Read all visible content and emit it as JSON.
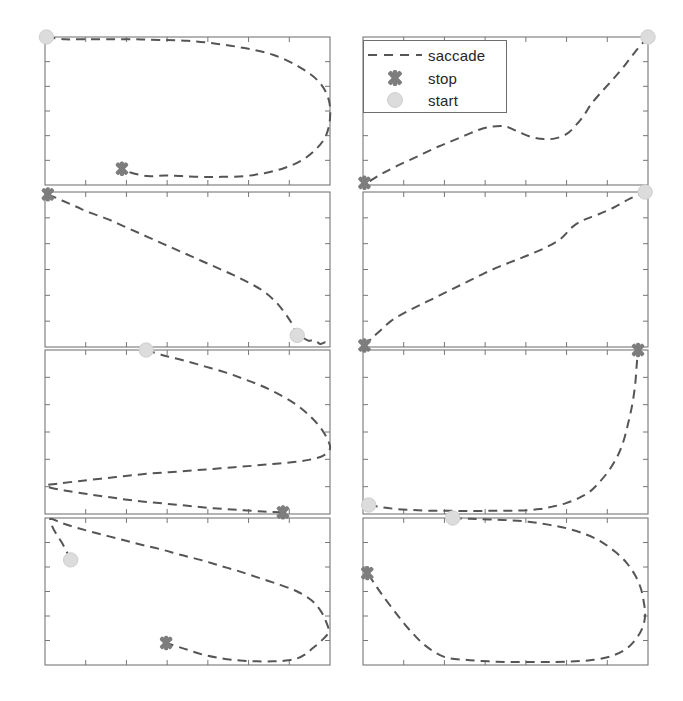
{
  "figure": {
    "kind": "small-multiples-trajectory-grid",
    "rows": 4,
    "cols": 2,
    "background": "#ffffff"
  },
  "legend": {
    "position": "top-right-panel-overlay",
    "border_color": "#6e6e6e",
    "entries": [
      {
        "key": "saccade-dashed-line",
        "label": "saccade",
        "color": "#555555",
        "style": "dashed"
      },
      {
        "key": "stop-marker",
        "label": "stop",
        "color": "#7d7d7d",
        "style": "x-marker"
      },
      {
        "key": "start-marker",
        "label": "start",
        "color": "#dcdcdc",
        "style": "circle-marker"
      }
    ]
  },
  "colors": {
    "saccade_line": "#555555",
    "stop_marker": "#7d7d7d",
    "start_marker": "#dcdcdc",
    "axis": "#777777",
    "text": "#262626"
  },
  "chart_data": {
    "type": "line",
    "title": "",
    "subtitle": "",
    "xlabel": "",
    "ylabel": "",
    "grid": false,
    "legend_position": "top-right",
    "axis_ticks": {
      "x_count": 7,
      "y_count": 6,
      "tick_direction": "inward",
      "tick_labels": []
    },
    "xlim": [
      0,
      1
    ],
    "ylim": [
      0,
      1
    ],
    "note": "Each panel is one saccade trajectory in normalized panel coordinates; x to the right, y upward (0 at panel bottom, 1 at panel top). Markers: start circle, stop X.",
    "panels": [
      {
        "index": 1,
        "position": "row1-col1",
        "start": [
          0.005,
          1.0
        ],
        "stop": [
          0.27,
          0.11
        ],
        "x": [
          0.005,
          0.07,
          0.14,
          0.22,
          0.31,
          0.4,
          0.5,
          0.6,
          0.7,
          0.8,
          0.89,
          0.96,
          0.995,
          1.0,
          0.985,
          0.95,
          0.9,
          0.84,
          0.77,
          0.7,
          0.62,
          0.55,
          0.48,
          0.42,
          0.36,
          0.3,
          0.27
        ],
        "y": [
          1.0,
          0.985,
          0.985,
          0.985,
          0.985,
          0.98,
          0.975,
          0.955,
          0.925,
          0.88,
          0.8,
          0.7,
          0.58,
          0.45,
          0.33,
          0.24,
          0.165,
          0.115,
          0.08,
          0.06,
          0.055,
          0.055,
          0.06,
          0.065,
          0.06,
          0.085,
          0.11
        ]
      },
      {
        "index": 2,
        "position": "row1-col2",
        "start": [
          1.0,
          1.0
        ],
        "stop": [
          0.005,
          0.015
        ],
        "x": [
          1.0,
          0.955,
          0.915,
          0.875,
          0.835,
          0.8,
          0.775,
          0.745,
          0.715,
          0.675,
          0.635,
          0.59,
          0.545,
          0.5,
          0.455,
          0.41,
          0.365,
          0.315,
          0.265,
          0.215,
          0.165,
          0.115,
          0.07,
          0.035,
          0.015,
          0.005
        ],
        "y": [
          1.0,
          0.9,
          0.8,
          0.71,
          0.625,
          0.545,
          0.47,
          0.4,
          0.345,
          0.315,
          0.31,
          0.325,
          0.36,
          0.395,
          0.395,
          0.375,
          0.34,
          0.3,
          0.26,
          0.215,
          0.17,
          0.125,
          0.08,
          0.04,
          0.015,
          0.015
        ]
      },
      {
        "index": 3,
        "position": "row2-col1",
        "start": [
          0.885,
          0.075
        ],
        "stop": [
          0.01,
          0.985
        ],
        "x": [
          0.01,
          0.06,
          0.11,
          0.16,
          0.22,
          0.275,
          0.33,
          0.385,
          0.44,
          0.495,
          0.55,
          0.605,
          0.66,
          0.715,
          0.77,
          0.82,
          0.865,
          0.885,
          0.905,
          0.925,
          0.945,
          0.965,
          0.985,
          1.0
        ],
        "y": [
          0.985,
          0.945,
          0.905,
          0.865,
          0.825,
          0.78,
          0.735,
          0.69,
          0.645,
          0.6,
          0.555,
          0.51,
          0.465,
          0.415,
          0.355,
          0.27,
          0.155,
          0.075,
          0.06,
          0.04,
          0.045,
          0.02,
          0.03,
          0.005
        ]
      },
      {
        "index": 4,
        "position": "row2-col2",
        "start": [
          0.99,
          1.0
        ],
        "stop": [
          0.005,
          0.01
        ],
        "x": [
          0.005,
          0.03,
          0.06,
          0.1,
          0.15,
          0.205,
          0.26,
          0.315,
          0.37,
          0.425,
          0.48,
          0.535,
          0.59,
          0.645,
          0.695,
          0.735,
          0.775,
          0.825,
          0.88,
          0.935,
          0.99
        ],
        "y": [
          0.01,
          0.055,
          0.105,
          0.17,
          0.225,
          0.275,
          0.325,
          0.375,
          0.425,
          0.475,
          0.52,
          0.56,
          0.6,
          0.645,
          0.7,
          0.775,
          0.82,
          0.855,
          0.9,
          0.955,
          1.0
        ]
      },
      {
        "index": 5,
        "position": "row3-col1",
        "start": [
          0.355,
          1.0
        ],
        "stop": [
          0.835,
          0.01
        ],
        "x": [
          0.355,
          0.42,
          0.49,
          0.56,
          0.63,
          0.695,
          0.755,
          0.815,
          0.875,
          0.925,
          0.965,
          0.99,
          1.0,
          0.975,
          0.925,
          0.865,
          0.8,
          0.735,
          0.665,
          0.59,
          0.515,
          0.435,
          0.355,
          0.275,
          0.195,
          0.115,
          0.045,
          0.005,
          0.02,
          0.08,
          0.155,
          0.235,
          0.32,
          0.41,
          0.5,
          0.59,
          0.68,
          0.765,
          0.835
        ],
        "y": [
          1.0,
          0.965,
          0.935,
          0.9,
          0.865,
          0.825,
          0.785,
          0.735,
          0.675,
          0.605,
          0.53,
          0.46,
          0.4,
          0.355,
          0.33,
          0.315,
          0.305,
          0.295,
          0.285,
          0.275,
          0.265,
          0.255,
          0.245,
          0.23,
          0.215,
          0.2,
          0.185,
          0.175,
          0.16,
          0.14,
          0.12,
          0.1,
          0.08,
          0.065,
          0.05,
          0.035,
          0.025,
          0.015,
          0.01
        ]
      },
      {
        "index": 6,
        "position": "row3-col2",
        "start": [
          0.02,
          0.055
        ],
        "stop": [
          0.965,
          1.0
        ],
        "x": [
          0.02,
          0.07,
          0.12,
          0.175,
          0.23,
          0.29,
          0.345,
          0.4,
          0.455,
          0.51,
          0.565,
          0.62,
          0.665,
          0.71,
          0.755,
          0.795,
          0.83,
          0.865,
          0.895,
          0.915,
          0.93,
          0.945,
          0.955,
          0.96,
          0.965
        ],
        "y": [
          0.055,
          0.04,
          0.03,
          0.025,
          0.02,
          0.02,
          0.018,
          0.018,
          0.02,
          0.02,
          0.022,
          0.03,
          0.045,
          0.065,
          0.095,
          0.135,
          0.195,
          0.27,
          0.36,
          0.45,
          0.55,
          0.67,
          0.79,
          0.9,
          1.0
        ]
      },
      {
        "index": 7,
        "position": "row4-col1",
        "start": [
          0.09,
          0.715
        ],
        "stop": [
          0.425,
          0.15
        ],
        "x": [
          0.09,
          0.075,
          0.06,
          0.04,
          0.025,
          0.02,
          0.06,
          0.11,
          0.165,
          0.225,
          0.285,
          0.345,
          0.41,
          0.475,
          0.545,
          0.615,
          0.685,
          0.755,
          0.825,
          0.885,
          0.935,
          0.965,
          0.985,
          0.995,
          0.97,
          0.94,
          0.915,
          0.885,
          0.845,
          0.8,
          0.745,
          0.685,
          0.62,
          0.555,
          0.49,
          0.425
        ],
        "y": [
          0.715,
          0.775,
          0.83,
          0.89,
          0.945,
          0.995,
          0.965,
          0.935,
          0.905,
          0.875,
          0.845,
          0.815,
          0.785,
          0.75,
          0.715,
          0.675,
          0.635,
          0.59,
          0.545,
          0.5,
          0.44,
          0.375,
          0.3,
          0.225,
          0.165,
          0.115,
          0.075,
          0.045,
          0.03,
          0.025,
          0.025,
          0.03,
          0.045,
          0.07,
          0.11,
          0.15
        ]
      },
      {
        "index": 8,
        "position": "row4-col2",
        "start": [
          0.315,
          1.0
        ],
        "stop": [
          0.015,
          0.625
        ],
        "x": [
          0.315,
          0.375,
          0.44,
          0.51,
          0.58,
          0.65,
          0.715,
          0.78,
          0.835,
          0.885,
          0.925,
          0.955,
          0.975,
          0.985,
          0.99,
          0.98,
          0.955,
          0.92,
          0.87,
          0.81,
          0.745,
          0.675,
          0.6,
          0.52,
          0.44,
          0.36,
          0.285,
          0.22,
          0.165,
          0.115,
          0.07,
          0.04,
          0.015
        ],
        "y": [
          1.0,
          0.995,
          0.99,
          0.985,
          0.975,
          0.955,
          0.93,
          0.89,
          0.84,
          0.77,
          0.695,
          0.61,
          0.52,
          0.43,
          0.34,
          0.25,
          0.17,
          0.105,
          0.06,
          0.035,
          0.025,
          0.02,
          0.02,
          0.02,
          0.025,
          0.035,
          0.055,
          0.13,
          0.235,
          0.355,
          0.47,
          0.555,
          0.625
        ]
      }
    ]
  }
}
